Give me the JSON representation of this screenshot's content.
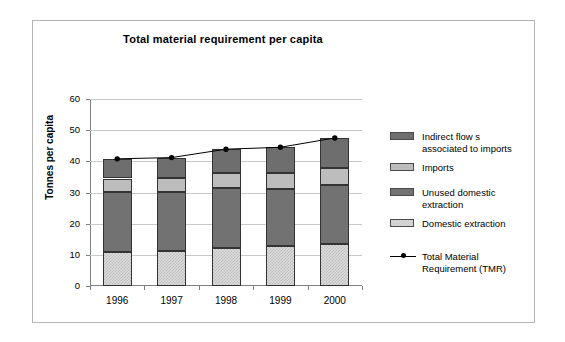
{
  "chart_data": {
    "type": "bar",
    "subtype": "stacked-bar-with-line-overlay",
    "title": "Total material requirement per capita",
    "xlabel": "",
    "ylabel": "Tonnes per capita",
    "categories": [
      "1996",
      "1997",
      "1998",
      "1999",
      "2000"
    ],
    "ylim": [
      0,
      60
    ],
    "yticks": [
      0,
      10,
      20,
      30,
      40,
      50,
      60
    ],
    "ytick_labels": [
      "0",
      "10",
      "20",
      "30",
      "40",
      "50",
      "60"
    ],
    "grid": true,
    "legend_position": "right",
    "series": [
      {
        "name": "Domestic extraction",
        "values": [
          11.0,
          11.2,
          12.3,
          12.7,
          13.5
        ],
        "color": "#dcdcdc",
        "stack_order": 1
      },
      {
        "name": "Unused domestic extraction",
        "values": [
          19.3,
          19.1,
          19.2,
          18.4,
          19.0
        ],
        "color": "#727272",
        "stack_order": 2
      },
      {
        "name": "Imports",
        "values": [
          4.2,
          4.4,
          4.8,
          5.2,
          5.5
        ],
        "color": "#bdbdbd",
        "stack_order": 3
      },
      {
        "name": "Indirect flows associated to imports",
        "values": [
          6.3,
          6.5,
          7.6,
          8.2,
          9.5
        ],
        "color": "#6e6e6e",
        "stack_order": 4
      }
    ],
    "line_series": {
      "name": "Total Material Requirement (TMR)",
      "values": [
        40.8,
        41.2,
        43.9,
        44.5,
        47.5
      ],
      "color": "#000000",
      "marker": "filled-circle"
    }
  },
  "legend": {
    "items": [
      {
        "label": "Indirect flow s\nassociated to imports",
        "swatch": "dark-gray-swatch"
      },
      {
        "label": "Imports",
        "swatch": "medium-gray-swatch"
      },
      {
        "label": "Unused domestic\nextraction",
        "swatch": "dark-gray-swatch"
      },
      {
        "label": "Domestic extraction",
        "swatch": "light-gray-swatch"
      },
      {
        "label": "Total Material\nRequirement (TMR)",
        "swatch": "line-marker-swatch"
      }
    ]
  },
  "axis": {
    "y_title": "Tonnes per capita",
    "y_labels": [
      "60",
      "50",
      "40",
      "30",
      "20",
      "10",
      "0"
    ],
    "x_labels": [
      "1996",
      "1997",
      "1998",
      "1999",
      "2000"
    ]
  },
  "colors": {
    "indirect": "#6e6e6e",
    "imports": "#bdbdbd",
    "unused": "#727272",
    "domestic": "#dcdcdc",
    "line": "#000000",
    "grid": "#c8c8c8",
    "axis": "#808080",
    "frame": "#b5b5b5"
  }
}
